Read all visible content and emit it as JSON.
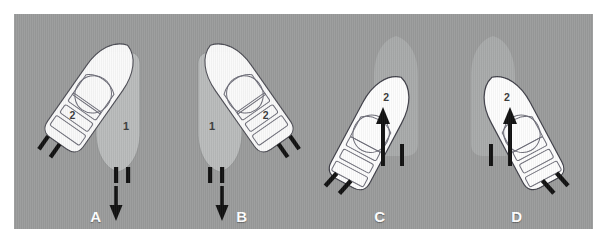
{
  "figure": {
    "background_color": "#9a9b9b",
    "border_color": "#ffffff",
    "panels": [
      {
        "caption": "A",
        "boats": [
          {
            "label": "1",
            "role": "stand-on-vessel",
            "fill": "#b9bbbb",
            "heading_deg": 180,
            "has_arrow": true,
            "arrow_direction": "down"
          },
          {
            "label": "2",
            "role": "give-way-vessel",
            "fill": "#fdfdfd",
            "heading_deg": 145,
            "has_arrow": false
          }
        ]
      },
      {
        "caption": "B",
        "boats": [
          {
            "label": "1",
            "role": "stand-on-vessel",
            "fill": "#b9bbbb",
            "heading_deg": 180,
            "has_arrow": true,
            "arrow_direction": "down"
          },
          {
            "label": "2",
            "role": "give-way-vessel",
            "fill": "#fdfdfd",
            "heading_deg": 215,
            "has_arrow": false
          }
        ]
      },
      {
        "caption": "C",
        "boats": [
          {
            "label": "1",
            "role": "stand-on-vessel",
            "fill": "#a6a8a8",
            "heading_deg": 0,
            "has_arrow": false
          },
          {
            "label": "2",
            "role": "give-way-vessel",
            "fill": "#fdfdfd",
            "heading_deg": 28,
            "has_arrow": true,
            "arrow_direction": "up"
          }
        ]
      },
      {
        "caption": "D",
        "boats": [
          {
            "label": "1",
            "role": "stand-on-vessel",
            "fill": "#a6a8a8",
            "heading_deg": 0,
            "has_arrow": false
          },
          {
            "label": "2",
            "role": "give-way-vessel",
            "fill": "#fdfdfd",
            "heading_deg": -28,
            "has_arrow": true,
            "arrow_direction": "up"
          }
        ]
      }
    ],
    "legend": {
      "boat_one_label": "1",
      "boat_two_label": "2"
    },
    "colors": {
      "boat_white": "#fdfdfd",
      "boat_gray": "#b9bbbb",
      "boat_gray_solid": "#a6a8a8",
      "outline": "#4a4a52",
      "motor": "#111111",
      "arrow": "#111111",
      "caption": "#ffffff"
    }
  }
}
